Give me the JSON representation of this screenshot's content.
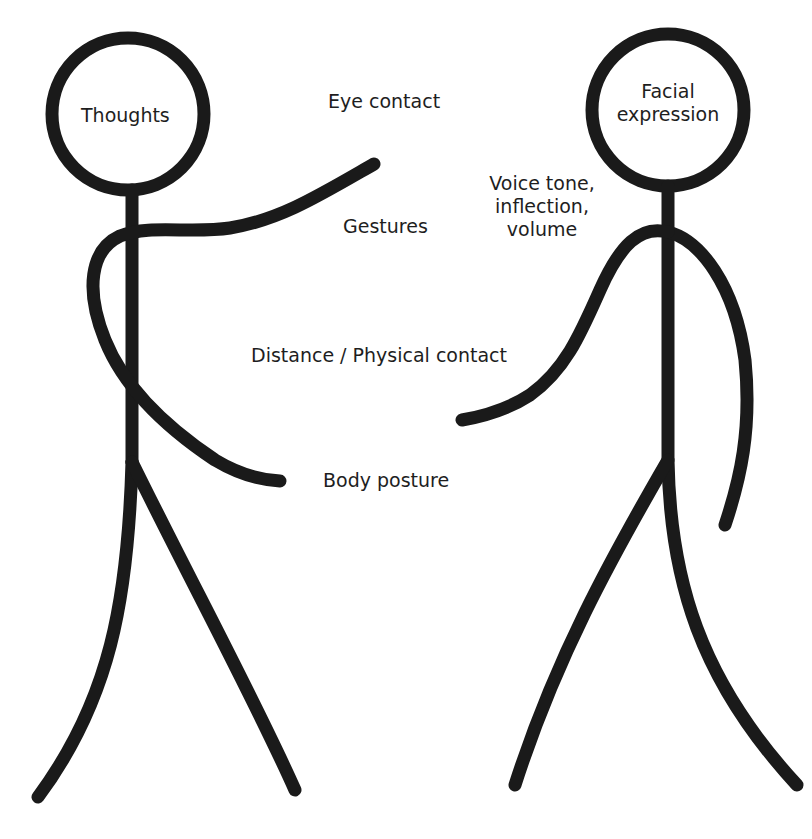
{
  "diagram": {
    "title": "",
    "figures": [
      {
        "id": "left",
        "head_label": "Thoughts"
      },
      {
        "id": "right",
        "head_label_lines": [
          "Facial",
          "expression"
        ]
      }
    ],
    "labels": {
      "eye_contact": "Eye contact",
      "gestures": "Gestures",
      "voice_lines": [
        "Voice tone,",
        "inflection,",
        "volume"
      ],
      "distance": "Distance / Physical contact",
      "body_posture": "Body posture"
    },
    "colors": {
      "stroke": "#1a1a1a",
      "background": "#ffffff",
      "text": "#1e1e1e"
    }
  }
}
